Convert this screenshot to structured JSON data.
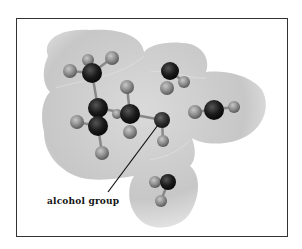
{
  "figure": {
    "type": "molecular model with electron density surface",
    "annotation": {
      "label": "alcohol group",
      "pointer_from": [
        105,
        195
      ],
      "pointer_to": [
        158,
        123
      ]
    },
    "colors": {
      "surface": "#c8c8c8",
      "carbon": "#1a1a1a",
      "oxygen": "#2e2e2e",
      "hydrogen": "#8a8a8a",
      "frame": "#333333"
    },
    "atoms": [
      {
        "id": "H1",
        "kind": "hydrogen",
        "x": 70,
        "y": 71,
        "r": 7
      },
      {
        "id": "H2",
        "kind": "hydrogen",
        "x": 88,
        "y": 60,
        "r": 6
      },
      {
        "id": "H3",
        "kind": "hydrogen",
        "x": 112,
        "y": 58,
        "r": 7
      },
      {
        "id": "C1",
        "kind": "carbon",
        "x": 92,
        "y": 73,
        "r": 10
      },
      {
        "id": "H4",
        "kind": "hydrogen",
        "x": 127,
        "y": 87,
        "r": 7
      },
      {
        "id": "C2",
        "kind": "carbon",
        "x": 98,
        "y": 108,
        "r": 10
      },
      {
        "id": "C3",
        "kind": "carbon",
        "x": 98,
        "y": 126,
        "r": 10
      },
      {
        "id": "H5",
        "kind": "hydrogen",
        "x": 77,
        "y": 122,
        "r": 7
      },
      {
        "id": "H6",
        "kind": "hydrogen",
        "x": 102,
        "y": 153,
        "r": 7
      },
      {
        "id": "C4",
        "kind": "carbon",
        "x": 130,
        "y": 114,
        "r": 10
      },
      {
        "id": "H7",
        "kind": "hydrogen",
        "x": 130,
        "y": 132,
        "r": 7
      },
      {
        "id": "H8",
        "kind": "hydrogen",
        "x": 117,
        "y": 114,
        "r": 5
      },
      {
        "id": "O1",
        "kind": "oxygen",
        "x": 162,
        "y": 120,
        "r": 8
      },
      {
        "id": "H9",
        "kind": "hydrogen",
        "x": 163,
        "y": 141,
        "r": 6
      },
      {
        "id": "C5",
        "kind": "carbon",
        "x": 170,
        "y": 71,
        "r": 9
      },
      {
        "id": "H10",
        "kind": "hydrogen",
        "x": 167,
        "y": 88,
        "r": 7
      },
      {
        "id": "H11",
        "kind": "hydrogen",
        "x": 184,
        "y": 82,
        "r": 6
      },
      {
        "id": "H12",
        "kind": "hydrogen",
        "x": 195,
        "y": 112,
        "r": 7
      },
      {
        "id": "C6",
        "kind": "carbon",
        "x": 214,
        "y": 110,
        "r": 10
      },
      {
        "id": "H13",
        "kind": "hydrogen",
        "x": 234,
        "y": 107,
        "r": 6
      },
      {
        "id": "C7",
        "kind": "carbon",
        "x": 168,
        "y": 182,
        "r": 8
      },
      {
        "id": "H14",
        "kind": "hydrogen",
        "x": 155,
        "y": 182,
        "r": 6
      },
      {
        "id": "H15",
        "kind": "hydrogen",
        "x": 161,
        "y": 201,
        "r": 6
      }
    ]
  }
}
